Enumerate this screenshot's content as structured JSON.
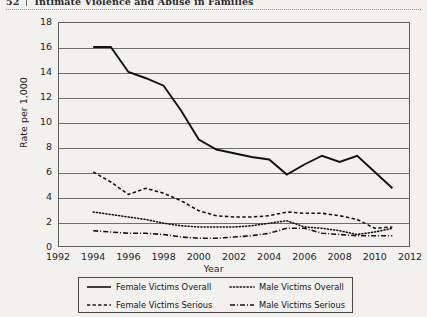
{
  "header": {
    "page_number": "52",
    "running_title": "Intimate Violence and Abuse in Families"
  },
  "chart_data": {
    "type": "line",
    "title": "",
    "xlabel": "Year",
    "ylabel": "Rate per 1,000",
    "xlim": [
      1992,
      2012
    ],
    "ylim": [
      0,
      18
    ],
    "xticks": [
      1992,
      1994,
      1996,
      1998,
      2000,
      2002,
      2004,
      2006,
      2008,
      2010,
      2012
    ],
    "yticks": [
      0,
      2,
      4,
      6,
      8,
      10,
      12,
      14,
      16,
      18
    ],
    "grid": true,
    "legend_position": "below",
    "x": [
      1994,
      1995,
      1996,
      1997,
      1998,
      1999,
      2000,
      2001,
      2002,
      2003,
      2004,
      2005,
      2006,
      2007,
      2008,
      2009,
      2010,
      2011
    ],
    "series": [
      {
        "name": "Female Victims Overall",
        "style": "solid",
        "values": [
          16.0,
          16.0,
          14.0,
          13.5,
          12.9,
          10.9,
          8.6,
          7.8,
          7.5,
          7.2,
          7.0,
          5.8,
          6.6,
          7.3,
          6.8,
          7.3,
          6.0,
          4.7
        ]
      },
      {
        "name": "Male Victims Overall",
        "style": "dotted",
        "values": [
          2.8,
          2.6,
          2.4,
          2.2,
          1.9,
          1.7,
          1.6,
          1.6,
          1.6,
          1.7,
          1.9,
          2.1,
          1.6,
          1.5,
          1.3,
          1.0,
          1.2,
          1.5
        ]
      },
      {
        "name": "Female Victims Serious",
        "style": "dashed",
        "values": [
          6.0,
          5.2,
          4.2,
          4.7,
          4.3,
          3.7,
          2.9,
          2.5,
          2.4,
          2.4,
          2.5,
          2.8,
          2.7,
          2.7,
          2.5,
          2.2,
          1.5,
          1.6
        ]
      },
      {
        "name": "Male Victims Serious",
        "style": "dashdot",
        "values": [
          1.3,
          1.2,
          1.1,
          1.1,
          1.0,
          0.8,
          0.7,
          0.7,
          0.8,
          0.9,
          1.1,
          1.5,
          1.5,
          1.1,
          1.0,
          0.9,
          0.9,
          0.9
        ]
      }
    ]
  },
  "legend": {
    "items": [
      {
        "label": "Female Victims Overall",
        "style": "solid"
      },
      {
        "label": "Male Victims Overall",
        "style": "dotted"
      },
      {
        "label": "Female Victims Serious",
        "style": "dashed"
      },
      {
        "label": "Male Victims Serious",
        "style": "dashdot"
      }
    ]
  }
}
